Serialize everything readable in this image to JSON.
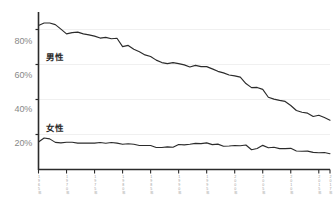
{
  "chart_data": {
    "type": "line",
    "title": "",
    "subtitle": "",
    "xlabel": "",
    "ylabel": "",
    "ylim": [
      0,
      90
    ],
    "xlim": [
      1965,
      2017
    ],
    "grid": true,
    "legend_position": "inline",
    "yticks": [
      20,
      40,
      60,
      80
    ],
    "ytick_labels": [
      "20%",
      "40%",
      "60%",
      "80%"
    ],
    "xticks": [
      1965,
      1970,
      1975,
      1980,
      1985,
      1990,
      1995,
      2000,
      2005,
      2010,
      2015,
      2017
    ],
    "xtick_labels": [
      "1965年",
      "1970年",
      "1975年",
      "1980年",
      "1985年",
      "1990年",
      "1995年",
      "2000年",
      "2005年",
      "2010年",
      "2015年",
      "2017年"
    ],
    "x": [
      1965,
      1966,
      1967,
      1968,
      1969,
      1970,
      1971,
      1972,
      1973,
      1974,
      1975,
      1976,
      1977,
      1978,
      1979,
      1980,
      1981,
      1982,
      1983,
      1984,
      1985,
      1986,
      1987,
      1988,
      1989,
      1990,
      1991,
      1992,
      1993,
      1994,
      1995,
      1996,
      1997,
      1998,
      1999,
      2000,
      2001,
      2002,
      2003,
      2004,
      2005,
      2006,
      2007,
      2008,
      2009,
      2010,
      2011,
      2012,
      2013,
      2014,
      2015,
      2016,
      2017
    ],
    "series": [
      {
        "name": "男性",
        "label": "男性",
        "color": "#2b2b2b",
        "values": [
          82.3,
          83.7,
          83.7,
          82.8,
          80.2,
          77.5,
          78.2,
          78.5,
          77.5,
          76.9,
          76.2,
          75.1,
          75.5,
          74.7,
          75.0,
          70.2,
          70.9,
          68.7,
          67.3,
          65.5,
          64.6,
          62.5,
          61.1,
          60.5,
          61.1,
          60.5,
          59.8,
          58.6,
          59.5,
          58.8,
          58.8,
          57.5,
          56.1,
          55.2,
          54.0,
          53.5,
          52.8,
          49.1,
          46.8,
          46.9,
          45.8,
          41.3,
          40.2,
          39.5,
          38.9,
          36.6,
          33.7,
          32.7,
          32.2,
          30.3,
          31.0,
          29.7,
          28.2
        ]
      },
      {
        "name": "女性",
        "label": "女性",
        "color": "#2b2b2b",
        "values": [
          15.7,
          18.0,
          17.5,
          15.5,
          15.2,
          15.6,
          15.6,
          15.1,
          15.1,
          15.1,
          15.1,
          15.4,
          15.0,
          15.4,
          15.1,
          14.4,
          14.7,
          14.4,
          13.7,
          13.7,
          13.7,
          12.6,
          12.6,
          12.9,
          12.7,
          14.3,
          14.1,
          14.4,
          14.9,
          14.8,
          15.2,
          14.2,
          14.5,
          13.3,
          13.4,
          13.7,
          13.6,
          14.0,
          11.3,
          12.0,
          13.8,
          12.4,
          12.7,
          11.9,
          11.9,
          12.1,
          10.6,
          10.4,
          10.5,
          9.8,
          9.6,
          9.7,
          9.0
        ]
      }
    ]
  },
  "axis": {
    "y_label_20": "20%",
    "y_label_40": "40%",
    "y_label_60": "60%",
    "y_label_80": "80%"
  },
  "labels": {
    "male": "男性",
    "female": "女性"
  },
  "colors": {
    "line": "#2b2b2b",
    "axis": "#2b2b2b",
    "grid": "#f0f0f0",
    "tick_text": "#9a9a9a",
    "ylabel_text": "#888888"
  }
}
